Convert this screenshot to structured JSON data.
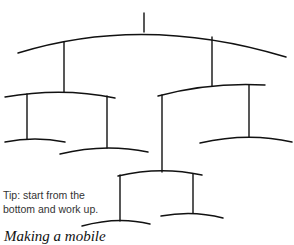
{
  "diagram": {
    "type": "mobile",
    "tip_lines": [
      "Tip: start from the",
      "bottom and work up."
    ],
    "caption": "Making a mobile",
    "stroke_color": "#111111"
  }
}
